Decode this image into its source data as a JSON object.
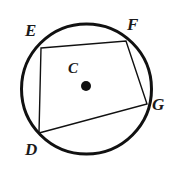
{
  "figure": {
    "type": "geometry-diagram",
    "background_color": "#ffffff",
    "stroke_color": "#111111",
    "circle": {
      "name": "circle-C",
      "center_label": "C",
      "center_x": 86.5,
      "center_y": 89,
      "radius": 65,
      "stroke_width": 3
    },
    "center_point": {
      "name": "center-dot",
      "x": 86,
      "y": 86,
      "radius": 5,
      "fill": "#111111"
    },
    "vertices": [
      {
        "label": "E",
        "x": 41,
        "y": 48
      },
      {
        "label": "F",
        "x": 126,
        "y": 41
      },
      {
        "label": "G",
        "x": 147,
        "y": 104
      },
      {
        "label": "D",
        "x": 39,
        "y": 133
      }
    ],
    "polygon": {
      "name": "quadrilateral-DEFG",
      "points": "41,48 126,41 147,104 39,133",
      "fill": "none",
      "stroke_width": 1.4
    },
    "labels": {
      "E": "E",
      "F": "F",
      "G": "G",
      "D": "D",
      "C": "C"
    }
  }
}
